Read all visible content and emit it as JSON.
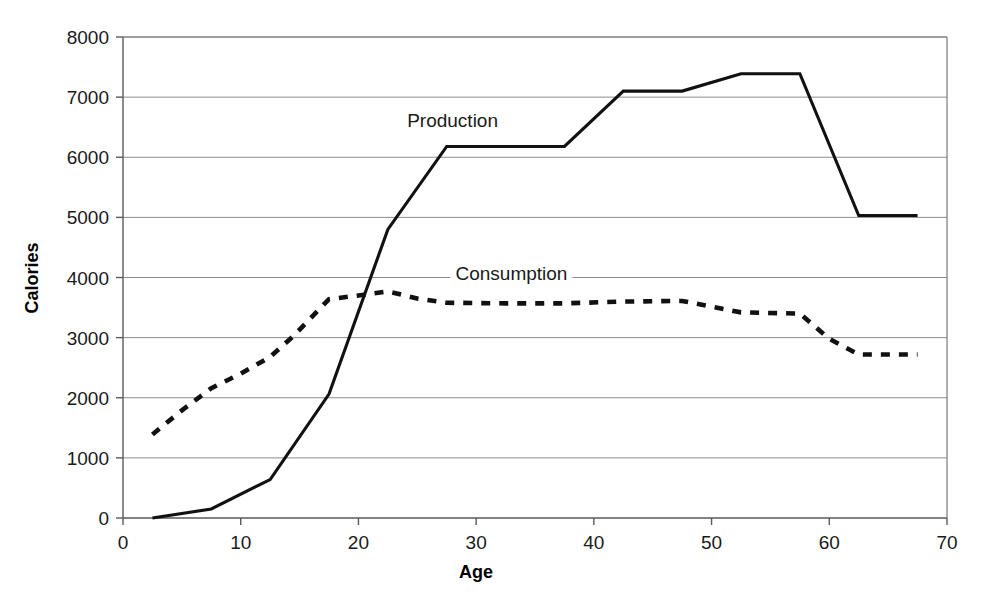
{
  "chart_data": {
    "type": "line",
    "title": "",
    "xlabel": "Age",
    "ylabel": "Calories",
    "xlim": [
      0,
      70
    ],
    "ylim": [
      0,
      8000
    ],
    "x_ticks": [
      0,
      10,
      20,
      30,
      40,
      50,
      60,
      70
    ],
    "y_ticks": [
      0,
      1000,
      2000,
      3000,
      4000,
      5000,
      6000,
      7000,
      8000
    ],
    "grid": true,
    "legend_position": "inline-annotations",
    "series": [
      {
        "name": "Production",
        "style": "solid",
        "color": "#111111",
        "label_x": 28,
        "label_y": 6500,
        "points": [
          {
            "x": 2.5,
            "y": 0
          },
          {
            "x": 7.5,
            "y": 150
          },
          {
            "x": 12.5,
            "y": 640
          },
          {
            "x": 17.5,
            "y": 2060
          },
          {
            "x": 22.5,
            "y": 4800
          },
          {
            "x": 27.5,
            "y": 6180
          },
          {
            "x": 37.5,
            "y": 6180
          },
          {
            "x": 42.5,
            "y": 7100
          },
          {
            "x": 47.5,
            "y": 7100
          },
          {
            "x": 52.5,
            "y": 7390
          },
          {
            "x": 57.5,
            "y": 7390
          },
          {
            "x": 62.5,
            "y": 5030
          },
          {
            "x": 67.5,
            "y": 5030
          }
        ]
      },
      {
        "name": "Consumption",
        "style": "dashed",
        "color": "#111111",
        "label_x": 33,
        "label_y": 3960,
        "points": [
          {
            "x": 2.5,
            "y": 1390
          },
          {
            "x": 5.0,
            "y": 1790
          },
          {
            "x": 7.5,
            "y": 2160
          },
          {
            "x": 10.0,
            "y": 2400
          },
          {
            "x": 12.5,
            "y": 2680
          },
          {
            "x": 14.5,
            "y": 3030
          },
          {
            "x": 17.5,
            "y": 3640
          },
          {
            "x": 20.0,
            "y": 3700
          },
          {
            "x": 22.5,
            "y": 3770
          },
          {
            "x": 25.0,
            "y": 3650
          },
          {
            "x": 27.5,
            "y": 3580
          },
          {
            "x": 32.5,
            "y": 3570
          },
          {
            "x": 37.5,
            "y": 3570
          },
          {
            "x": 42.5,
            "y": 3600
          },
          {
            "x": 47.5,
            "y": 3610
          },
          {
            "x": 52.5,
            "y": 3420
          },
          {
            "x": 57.5,
            "y": 3400
          },
          {
            "x": 60.0,
            "y": 2980
          },
          {
            "x": 62.5,
            "y": 2720
          },
          {
            "x": 67.5,
            "y": 2720
          }
        ]
      }
    ]
  },
  "axes": {
    "x_title": "Age",
    "y_title": "Calories",
    "x_tick_labels": [
      "0",
      "10",
      "20",
      "30",
      "40",
      "50",
      "60",
      "70"
    ],
    "y_tick_labels": [
      "0",
      "1000",
      "2000",
      "3000",
      "4000",
      "5000",
      "6000",
      "7000",
      "8000"
    ]
  },
  "annotations": {
    "production_label": "Production",
    "consumption_label": "Consumption"
  }
}
